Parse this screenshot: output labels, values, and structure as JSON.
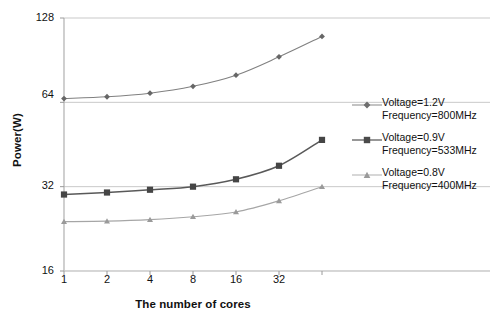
{
  "chart_data": {
    "type": "line",
    "title": "",
    "xlabel": "The number of cores",
    "ylabel": "Power(W)",
    "x": [
      1,
      2,
      4,
      8,
      16,
      32,
      64
    ],
    "xscale": "log2",
    "yscale": "log2",
    "xlim": [
      1,
      64
    ],
    "ylim": [
      16,
      128
    ],
    "xticks": [
      "1",
      "2",
      "4",
      "8",
      "16",
      "32"
    ],
    "yticks": [
      "16",
      "32",
      "64",
      "128"
    ],
    "grid": "horizontal",
    "legend_position": "right",
    "series": [
      {
        "name": "Voltage=1.2V",
        "name_line2": "Frequency=800MHz",
        "marker": "diamond",
        "color": "#808080",
        "values": [
          66,
          67,
          69,
          73,
          80,
          93,
          110
        ]
      },
      {
        "name": "Voltage=0.9V",
        "name_line2": "Frequency=533MHz",
        "marker": "square",
        "color": "#595959",
        "values": [
          30,
          30.5,
          31.2,
          32,
          34,
          38,
          47
        ]
      },
      {
        "name": "Voltage=0.8V",
        "name_line2": "Frequency=400MHz",
        "marker": "triangle",
        "color": "#a6a6a6",
        "values": [
          24,
          24.1,
          24.4,
          25,
          26,
          28.5,
          32
        ]
      }
    ]
  },
  "axis": {
    "ylabel": "Power(W)",
    "xlabel": "The number of cores",
    "yticks": [
      {
        "label": "128"
      },
      {
        "label": "64"
      },
      {
        "label": "32"
      },
      {
        "label": "16"
      }
    ],
    "xticks": [
      {
        "label": "1"
      },
      {
        "label": "2"
      },
      {
        "label": "4"
      },
      {
        "label": "8"
      },
      {
        "label": "16"
      },
      {
        "label": "32"
      }
    ]
  },
  "legend": {
    "items": [
      {
        "line1": "Voltage=1.2V",
        "line2": "Frequency=800MHz",
        "marker": "diamond-marker-icon"
      },
      {
        "line1": "Voltage=0.9V",
        "line2": "Frequency=533MHz",
        "marker": "square-marker-icon"
      },
      {
        "line1": "Voltage=0.8V",
        "line2": "Frequency=400MHz",
        "marker": "triangle-marker-icon"
      }
    ]
  }
}
